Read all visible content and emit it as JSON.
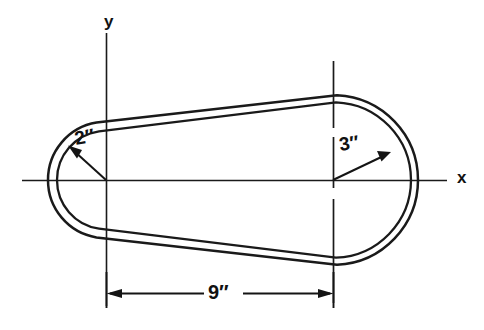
{
  "figure": {
    "type": "engineering-geometry-diagram",
    "background_color": "#ffffff",
    "line_color": "#1a1a1a"
  },
  "axes": {
    "x_label": "x",
    "y_label": "y",
    "x_axis": {
      "y_pixel": 180,
      "x_start": 22,
      "x_end": 447
    },
    "y_axis": {
      "x_pixel": 106,
      "y_start": 33,
      "y_end": 306
    }
  },
  "centers": {
    "left": {
      "label": "origin",
      "x": 106,
      "y": 180
    },
    "right": {
      "label": "right center",
      "x": 333,
      "y": 180
    }
  },
  "dimensions": [
    {
      "name": "left-radius",
      "value": "2",
      "unit": "″",
      "label": "2″",
      "kind": "radius",
      "anchor": "left-center"
    },
    {
      "name": "right-radius",
      "value": "3",
      "unit": "″",
      "label": "3″",
      "kind": "radius",
      "anchor": "right-center"
    },
    {
      "name": "center-distance",
      "value": "9",
      "unit": "″",
      "label": "9″",
      "kind": "linear",
      "anchor": "between-centers"
    }
  ],
  "labels": {
    "radius_left": "2″",
    "radius_right": "3″",
    "length": "9″",
    "axis_x": "x",
    "axis_y": "y"
  }
}
